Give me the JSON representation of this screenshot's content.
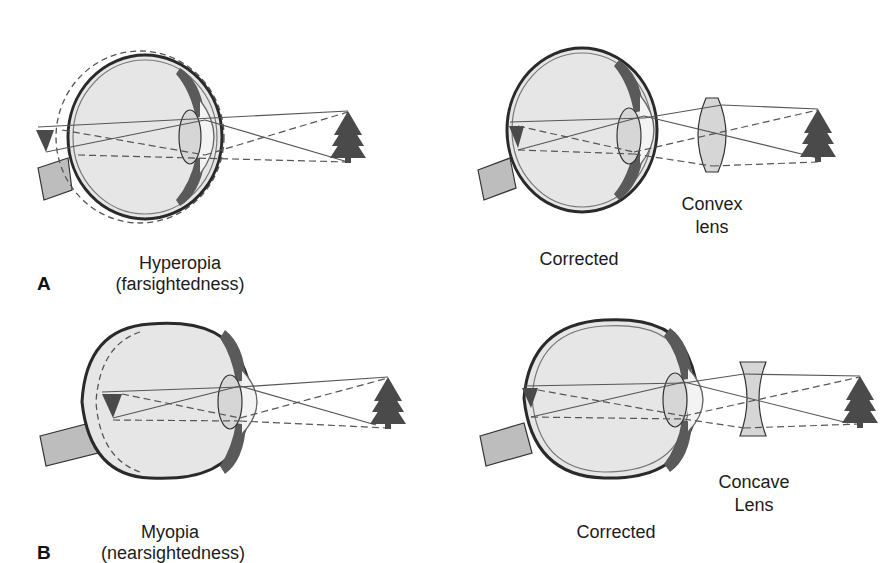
{
  "figure": {
    "panels": [
      {
        "id": "A",
        "letter": "A",
        "left": {
          "condition": "Hyperopia",
          "subtitle": "(farsightedness)",
          "eye_shape": "short eyeball",
          "focus": "behind retina"
        },
        "right": {
          "caption": "Corrected",
          "lens_label_line1": "Convex",
          "lens_label_line2": "lens",
          "lens_type": "convex"
        }
      },
      {
        "id": "B",
        "letter": "B",
        "left": {
          "condition": "Myopia",
          "subtitle": "(nearsightedness)",
          "eye_shape": "elongated eyeball",
          "focus": "in front of retina"
        },
        "right": {
          "caption": "Corrected",
          "lens_label_line1": "Concave",
          "lens_label_line2": "Lens",
          "lens_type": "concave"
        }
      }
    ],
    "object_icon": "tree-icon",
    "colors": {
      "eye_fill": "#e6e6e6",
      "eye_outline": "#2a2a2a",
      "sclera_shadow": "#7a7a7a",
      "lens_fill": "#d6d6d6",
      "tree": "#4a4a4a",
      "ray": "#555555",
      "optic_nerve": "#bdbdbd"
    }
  }
}
